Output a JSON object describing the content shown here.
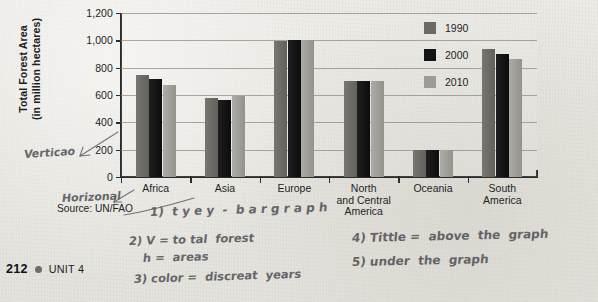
{
  "page": {
    "number": "212",
    "unit": "UNIT 4",
    "source": "Source: UN/FAO"
  },
  "chart_data": {
    "type": "bar",
    "title": "",
    "xlabel": "",
    "ylabel": "Total Forest Area\n(in million hectares)",
    "ylabel_line1": "Total Forest Area",
    "ylabel_line2": "(in million hectares)",
    "ylim": [
      0,
      1200
    ],
    "ytick_step": 200,
    "ytick_labels": [
      "1,200",
      "1,000",
      "800",
      "600",
      "400",
      "200",
      "0"
    ],
    "ytick_values": [
      1200,
      1000,
      800,
      600,
      400,
      200,
      0
    ],
    "grid": true,
    "grid_axis": "y",
    "legend_position": "inside-top-right",
    "categories": [
      "Africa",
      "Asia",
      "Europe",
      "North and Central America",
      "Oceania",
      "South America"
    ],
    "category_label_lines": [
      [
        "Africa"
      ],
      [
        "Asia"
      ],
      [
        "Europe"
      ],
      [
        "North",
        "and Central",
        "America"
      ],
      [
        "Oceania"
      ],
      [
        "South",
        "America"
      ]
    ],
    "series": [
      {
        "name": "1990",
        "color": "#6c6a65",
        "values": [
          750,
          575,
          995,
          700,
          200,
          935
        ]
      },
      {
        "name": "2000",
        "color": "#131313",
        "values": [
          720,
          565,
          1000,
          700,
          200,
          900
        ]
      },
      {
        "name": "2010",
        "color": "#9e9c96",
        "values": [
          675,
          590,
          1005,
          700,
          200,
          865
        ]
      }
    ]
  },
  "legend": {
    "items": [
      {
        "label": "1990",
        "color": "#6c6a65"
      },
      {
        "label": "2000",
        "color": "#131313"
      },
      {
        "label": "2010",
        "color": "#9e9c96"
      }
    ]
  },
  "annotations": {
    "vertical_label": "Verticao",
    "horizontal_label": "Horizonal",
    "notes": [
      "1) type - bargraph",
      "2) V= total forest",
      "h= areas",
      "3) color= discreat years",
      "4) Tittle = above the graph",
      "5) under the graph"
    ],
    "note_1": "1)  t y e y  -  b a r g r a p h",
    "note_2a": "2) V = to tal  forest",
    "note_2b": "h =  areas",
    "note_3": "3) color =  discreat  years",
    "note_4": "4) Tittle =  above  the  graph",
    "note_5": "5) under  the  graph"
  }
}
